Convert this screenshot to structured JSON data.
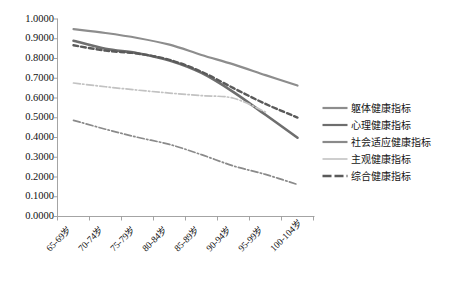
{
  "chart_data": {
    "type": "line",
    "title": "",
    "xlabel": "",
    "ylabel": "",
    "ylim": [
      0.0,
      1.0
    ],
    "ytick_step": 0.1,
    "grid": false,
    "legend_position": "right",
    "categories": [
      "65-69岁",
      "70-74岁",
      "75-79岁",
      "80-84岁",
      "85-89岁",
      "90-94岁",
      "95-99岁",
      "100-104岁"
    ],
    "ytick_labels": [
      "1.0000",
      "0.9000",
      "0.8000",
      "0.7000",
      "0.6000",
      "0.5000",
      "0.4000",
      "0.3000",
      "0.2000",
      "0.1000",
      "0.0000"
    ],
    "ytick_values": [
      1.0,
      0.9,
      0.8,
      0.7,
      0.6,
      0.5,
      0.4,
      0.3,
      0.2,
      0.1,
      0.0
    ],
    "series": [
      {
        "name": "躯体健康指标",
        "values": [
          0.949,
          0.929,
          0.904,
          0.87,
          0.818,
          0.77,
          0.716,
          0.663
        ],
        "color": "#8d8d8d",
        "style": "solid",
        "width": 2.2
      },
      {
        "name": "心理健康指标",
        "values": [
          0.89,
          0.849,
          0.827,
          0.79,
          0.727,
          0.63,
          0.515,
          0.399
        ],
        "color": "#6e6e6e",
        "style": "solid",
        "width": 2.6
      },
      {
        "name": "社会适应健康指标",
        "values": [
          0.487,
          0.442,
          0.401,
          0.365,
          0.313,
          0.256,
          0.213,
          0.162
        ],
        "color": "#8a8a8a",
        "style": "dashdot",
        "width": 1.7
      },
      {
        "name": "主观健康指标",
        "values": [
          0.676,
          0.657,
          0.64,
          0.625,
          0.612,
          0.599,
          0.529,
          null
        ],
        "color": "#c2c2c2",
        "style": "dashdot",
        "width": 1.7
      },
      {
        "name": "综合健康指标",
        "values": [
          0.867,
          0.84,
          0.825,
          0.793,
          0.733,
          0.65,
          0.57,
          0.501
        ],
        "color": "#5a5a5a",
        "style": "dashed",
        "width": 2.4
      }
    ]
  },
  "axis": {
    "line_color": "#9a9a9a",
    "tick_color": "#9a9a9a"
  },
  "legend": {
    "items": [
      {
        "label": "躯体健康指标",
        "style": "solid",
        "color": "#8d8d8d"
      },
      {
        "label": "心理健康指标",
        "style": "solid",
        "color": "#6e6e6e"
      },
      {
        "label": "社会适应健康指标",
        "style": "solid",
        "color": "#8a8a8a"
      },
      {
        "label": "主观健康指标",
        "style": "solid-light",
        "color": "#c9c9c9"
      },
      {
        "label": "综合健康指标",
        "style": "dashed",
        "color": "#5a5a5a"
      }
    ]
  }
}
